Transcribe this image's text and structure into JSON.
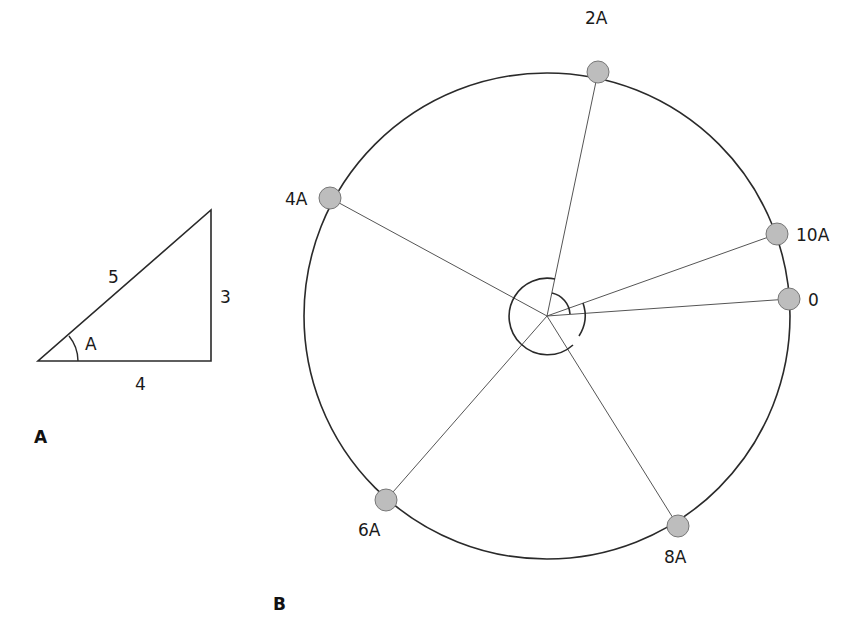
{
  "colors": {
    "stroke": "#2a2a2a",
    "spoke": "#555555",
    "node_fill": "#bdbdbd",
    "node_stroke": "#777777",
    "text": "#1a1a1a",
    "background": "#ffffff"
  },
  "panel_a": {
    "panel_label": "A",
    "triangle": {
      "hypotenuse_label": "5",
      "opposite_label": "3",
      "adjacent_label": "4",
      "angle_label": "A"
    }
  },
  "panel_b": {
    "panel_label": "B",
    "center_angle_arcs": "multiples of angle A marked at center",
    "points": [
      {
        "label": "0",
        "multiple": 0
      },
      {
        "label": "2A",
        "multiple": 2
      },
      {
        "label": "4A",
        "multiple": 4
      },
      {
        "label": "6A",
        "multiple": 6
      },
      {
        "label": "8A",
        "multiple": 8
      },
      {
        "label": "10A",
        "multiple": 10
      }
    ]
  }
}
